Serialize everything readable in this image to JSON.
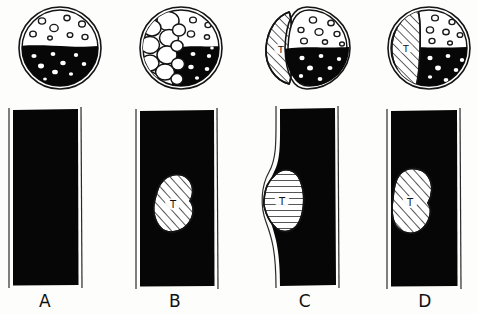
{
  "figure": {
    "style": "hand-drawn line illustration, black ink on white",
    "background_color": "#fdfdfb",
    "ink_color": "#111111",
    "fill_black": "#050505",
    "hatch_color": "#222222",
    "panel_count": 4
  },
  "panels": [
    {
      "id": "A",
      "label": "A",
      "cross_section": {
        "name": "cross-section-a",
        "description": "double-walled circle, upper half clear with small open circles, lower half solid black with small white dots",
        "wall": "double-line",
        "upper_fill": "white",
        "lower_fill": "black",
        "open_bubbles": 7,
        "white_dots": 8,
        "tumor_present": false,
        "tumor_label": ""
      },
      "longitudinal": {
        "name": "longitudinal-a",
        "description": "solid black rectangle, straight walls, no tumor",
        "fill": "black",
        "wall_deformed": false,
        "tumor_present": false,
        "tumor_label": ""
      }
    },
    {
      "id": "B",
      "label": "B",
      "cross_section": {
        "name": "cross-section-b",
        "description": "circle with cluster of large round bubbles filling the left side, upper-right clear with small circles, lower-right solid black with white dots",
        "wall": "double-line",
        "upper_fill": "white",
        "lower_fill": "black",
        "open_bubbles": 12,
        "white_dots": 6,
        "tumor_present": false,
        "tumor_label": ""
      },
      "longitudinal": {
        "name": "longitudinal-b",
        "description": "black rectangle with a hatched oval mass labelled T floating inside, walls straight and undisturbed",
        "fill": "black",
        "wall_deformed": false,
        "tumor_present": true,
        "tumor_label": "T",
        "tumor_hatch": "diagonal",
        "tumor_contact": "none"
      }
    },
    {
      "id": "C",
      "label": "C",
      "cross_section": {
        "name": "cross-section-c",
        "description": "circle with a large hatched tumor T bulging outside the left wall, remaining lumen clear above and black below",
        "wall": "double-line",
        "upper_fill": "white",
        "lower_fill": "black",
        "open_bubbles": 8,
        "white_dots": 7,
        "tumor_present": true,
        "tumor_label": "T",
        "tumor_hatch": "diagonal",
        "tumor_position": "exophytic-left"
      },
      "longitudinal": {
        "name": "longitudinal-c",
        "description": "black rectangle whose left wall is pushed outward by a hatched tumor T growing exophytically",
        "fill": "black",
        "wall_deformed": true,
        "tumor_present": true,
        "tumor_label": "T",
        "tumor_hatch": "horizontal",
        "tumor_contact": "exophytic"
      }
    },
    {
      "id": "D",
      "label": "D",
      "cross_section": {
        "name": "cross-section-d",
        "description": "circle with a hatched tumor T contained inside the left portion of the wall, lumen clear above and black below",
        "wall": "double-line",
        "upper_fill": "white",
        "lower_fill": "black",
        "open_bubbles": 8,
        "white_dots": 7,
        "tumor_present": true,
        "tumor_label": "T",
        "tumor_hatch": "diagonal",
        "tumor_position": "intramural-left"
      },
      "longitudinal": {
        "name": "longitudinal-d",
        "description": "black rectangle with a hatched tumor T abutting the straight left wall from inside",
        "fill": "black",
        "wall_deformed": false,
        "tumor_present": true,
        "tumor_label": "T",
        "tumor_hatch": "diagonal",
        "tumor_contact": "abuts-left-wall"
      }
    }
  ]
}
